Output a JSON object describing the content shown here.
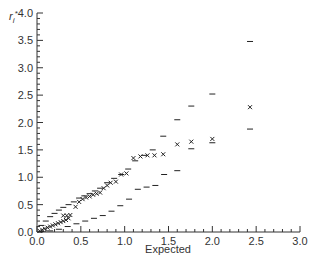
{
  "chart_data": {
    "type": "scatter",
    "title": "",
    "xlabel": "Expected",
    "ylabel": "r_i*",
    "xlim": [
      0,
      3.0
    ],
    "ylim": [
      0,
      4.0
    ],
    "x_ticks": [
      "0.0",
      "0.5",
      "1.0",
      "1.5",
      "2.0",
      "2.5",
      "3.0"
    ],
    "y_ticks": [
      "0.0",
      "0.5",
      "1.0",
      "1.5",
      "2.0",
      "2.5",
      "3.0",
      "3.5",
      "4.0"
    ],
    "grid": false,
    "legend": null,
    "series": [
      {
        "name": "observed",
        "marker": "x",
        "points": [
          [
            0.03,
            0.02
          ],
          [
            0.06,
            0.04
          ],
          [
            0.09,
            0.06
          ],
          [
            0.12,
            0.08
          ],
          [
            0.15,
            0.1
          ],
          [
            0.18,
            0.12
          ],
          [
            0.21,
            0.14
          ],
          [
            0.24,
            0.16
          ],
          [
            0.27,
            0.18
          ],
          [
            0.3,
            0.2
          ],
          [
            0.33,
            0.22
          ],
          [
            0.36,
            0.25
          ],
          [
            0.3,
            0.3
          ],
          [
            0.34,
            0.3
          ],
          [
            0.38,
            0.31
          ],
          [
            0.44,
            0.46
          ],
          [
            0.48,
            0.55
          ],
          [
            0.52,
            0.6
          ],
          [
            0.56,
            0.63
          ],
          [
            0.6,
            0.65
          ],
          [
            0.64,
            0.68
          ],
          [
            0.68,
            0.7
          ],
          [
            0.72,
            0.72
          ],
          [
            0.76,
            0.8
          ],
          [
            0.8,
            0.85
          ],
          [
            0.84,
            0.9
          ],
          [
            0.9,
            0.92
          ],
          [
            0.96,
            1.05
          ],
          [
            1.02,
            1.07
          ],
          [
            1.1,
            1.35
          ],
          [
            1.18,
            1.38
          ],
          [
            1.26,
            1.4
          ],
          [
            1.34,
            1.4
          ],
          [
            1.44,
            1.42
          ],
          [
            1.6,
            1.6
          ],
          [
            1.76,
            1.65
          ],
          [
            2.0,
            1.7
          ],
          [
            2.43,
            2.28
          ]
        ]
      },
      {
        "name": "upper_bound",
        "marker": "dash",
        "points": [
          [
            0.05,
            0.12
          ],
          [
            0.1,
            0.2
          ],
          [
            0.15,
            0.28
          ],
          [
            0.2,
            0.34
          ],
          [
            0.25,
            0.4
          ],
          [
            0.3,
            0.45
          ],
          [
            0.36,
            0.5
          ],
          [
            0.42,
            0.55
          ],
          [
            0.48,
            0.62
          ],
          [
            0.54,
            0.66
          ],
          [
            0.6,
            0.7
          ],
          [
            0.66,
            0.75
          ],
          [
            0.72,
            0.8
          ],
          [
            0.8,
            0.9
          ],
          [
            0.88,
            0.98
          ],
          [
            0.96,
            1.05
          ],
          [
            1.04,
            1.15
          ],
          [
            1.12,
            1.3
          ],
          [
            1.22,
            1.4
          ],
          [
            1.32,
            1.5
          ],
          [
            1.44,
            1.75
          ],
          [
            1.6,
            2.05
          ],
          [
            1.76,
            2.3
          ],
          [
            2.0,
            2.52
          ],
          [
            2.43,
            3.48
          ]
        ]
      },
      {
        "name": "lower_bound",
        "marker": "dash",
        "points": [
          [
            0.05,
            0.01
          ],
          [
            0.15,
            0.02
          ],
          [
            0.25,
            0.05
          ],
          [
            0.35,
            0.1
          ],
          [
            0.45,
            0.15
          ],
          [
            0.55,
            0.2
          ],
          [
            0.65,
            0.25
          ],
          [
            0.75,
            0.3
          ],
          [
            0.85,
            0.38
          ],
          [
            0.95,
            0.48
          ],
          [
            1.05,
            0.6
          ],
          [
            1.15,
            0.78
          ],
          [
            1.25,
            0.82
          ],
          [
            1.35,
            0.85
          ],
          [
            1.45,
            1.05
          ],
          [
            1.6,
            1.12
          ],
          [
            1.76,
            1.52
          ],
          [
            2.0,
            1.63
          ],
          [
            2.43,
            1.88
          ]
        ]
      }
    ]
  }
}
